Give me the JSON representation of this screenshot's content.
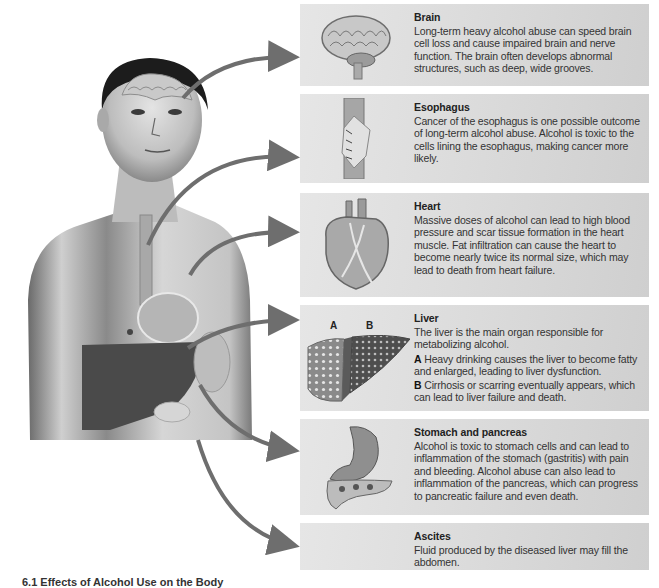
{
  "figure": {
    "arrow_color": "#6e6e6e",
    "caption": "6.1 Effects of Alcohol Use on the Body"
  },
  "panels": [
    {
      "id": "brain",
      "title": "Brain",
      "paragraphs": [
        {
          "label": "",
          "text": "Long-term heavy alcohol abuse can speed brain cell loss and cause impaired brain and nerve function. The brain often develops abnormal structures, such as deep, wide grooves."
        }
      ],
      "icon": "brain-icon"
    },
    {
      "id": "esophagus",
      "title": "Esophagus",
      "paragraphs": [
        {
          "label": "",
          "text": "Cancer of the esophagus is one possible outcome of long-term alcohol abuse. Alcohol is toxic to the cells lining the esophagus, making cancer more likely."
        }
      ],
      "icon": "esophagus-icon"
    },
    {
      "id": "heart",
      "title": "Heart",
      "paragraphs": [
        {
          "label": "",
          "text": "Massive doses of alcohol can lead to high blood pressure and scar tissue formation in the heart muscle. Fat infiltration can cause the heart to become nearly twice its normal size, which may lead to death from heart failure."
        }
      ],
      "icon": "heart-icon"
    },
    {
      "id": "liver",
      "title": "Liver",
      "image_labels": [
        "A",
        "B"
      ],
      "paragraphs": [
        {
          "label": "",
          "text": "The liver is the main organ responsible for metabolizing alcohol."
        },
        {
          "label": "A",
          "text": " Heavy drinking causes the liver to become fatty and enlarged, leading to liver dysfunction."
        },
        {
          "label": "B",
          "text": " Cirrhosis or scarring eventually appears, which can lead to liver failure and death."
        }
      ],
      "icon": "liver-icon"
    },
    {
      "id": "stomach-pancreas",
      "title": "Stomach and pancreas",
      "paragraphs": [
        {
          "label": "",
          "text": "Alcohol is toxic to stomach cells and can lead to inflammation of the stomach (gastritis) with pain and bleeding. Alcohol abuse can also lead to inflammation of the pancreas, which can progress to pancreatic failure and even death."
        }
      ],
      "icon": "stomach-pancreas-icon"
    },
    {
      "id": "ascites",
      "title": "Ascites",
      "paragraphs": [
        {
          "label": "",
          "text": "Fluid produced by the diseased liver may fill the abdomen."
        }
      ],
      "icon": ""
    }
  ]
}
